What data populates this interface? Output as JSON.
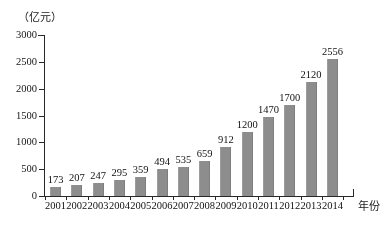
{
  "chart_data": {
    "type": "bar",
    "title": "",
    "subtitle": "",
    "xlabel": "年份",
    "ylabel": "（亿元）",
    "unit_note": "（亿元）",
    "categories": [
      "2001",
      "2002",
      "2003",
      "2004",
      "2005",
      "2006",
      "2007",
      "2008",
      "2009",
      "2010",
      "2011",
      "2012",
      "2013",
      "2014"
    ],
    "values": [
      173,
      207,
      247,
      295,
      359,
      494,
      535,
      659,
      912,
      1200,
      1470,
      1700,
      2120,
      2556
    ],
    "series": [
      {
        "name": "",
        "values": [
          173,
          207,
          247,
          295,
          359,
          494,
          535,
          659,
          912,
          1200,
          1470,
          1700,
          2120,
          2556
        ]
      }
    ],
    "ylim": [
      0,
      3000
    ],
    "ytick_values": [
      0,
      500,
      1000,
      1500,
      2000,
      2500,
      3000
    ],
    "ytick_labels": [
      "0",
      "500",
      "1000",
      "1500",
      "2000",
      "2500",
      "3000"
    ],
    "grid": false,
    "legend": false,
    "legend_position": "none",
    "data_labels": true,
    "bar_color": "#8d8d8d",
    "axis_color": "#2a2a2a",
    "text_color": "#141414"
  },
  "axis": {
    "unit_label": "（亿元）",
    "x_title": "年份"
  }
}
